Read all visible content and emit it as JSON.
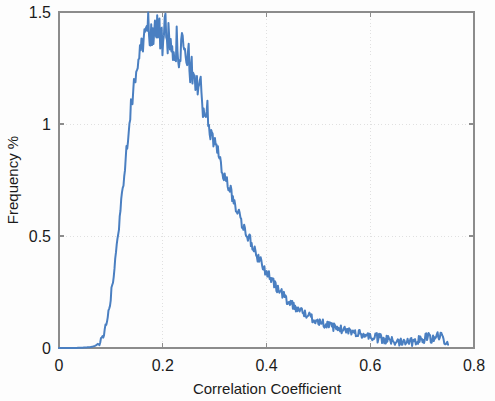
{
  "figure": {
    "background_color": "#fdfdfd",
    "axes_color": "#8c8c8c",
    "grid_color": "#d8d8d8",
    "text_color": "#1b1b1b"
  },
  "chart_data": {
    "type": "line",
    "title": "",
    "xlabel": "Correlation Coefficient",
    "ylabel": "Frequency %",
    "xlim": [
      0,
      0.8
    ],
    "ylim": [
      0,
      1.5
    ],
    "xticks": [
      0,
      0.2,
      0.4,
      0.6,
      0.8
    ],
    "xtick_labels": [
      "0",
      "0.2",
      "0.4",
      "0.6",
      "0.8"
    ],
    "yticks": [
      0,
      0.5,
      1,
      1.5
    ],
    "ytick_labels": [
      "0",
      "0.5",
      "1",
      "1.5"
    ],
    "grid": true,
    "legend": null,
    "legend_position": "none",
    "series": [
      {
        "name": "Correlation coefficient distribution",
        "color": "#4a7fc1",
        "line_width": 2.0,
        "x": [
          0.0,
          0.01,
          0.02,
          0.03,
          0.04,
          0.05,
          0.06,
          0.065,
          0.07,
          0.075,
          0.08,
          0.085,
          0.09,
          0.095,
          0.1,
          0.105,
          0.11,
          0.115,
          0.12,
          0.125,
          0.13,
          0.135,
          0.14,
          0.145,
          0.15,
          0.155,
          0.16,
          0.165,
          0.17,
          0.175,
          0.18,
          0.185,
          0.19,
          0.195,
          0.2,
          0.205,
          0.21,
          0.215,
          0.22,
          0.225,
          0.23,
          0.235,
          0.24,
          0.245,
          0.25,
          0.255,
          0.26,
          0.265,
          0.27,
          0.275,
          0.28,
          0.285,
          0.29,
          0.295,
          0.3,
          0.31,
          0.32,
          0.33,
          0.34,
          0.35,
          0.36,
          0.37,
          0.38,
          0.39,
          0.4,
          0.41,
          0.42,
          0.43,
          0.44,
          0.45,
          0.46,
          0.47,
          0.48,
          0.49,
          0.5,
          0.51,
          0.52,
          0.53,
          0.54,
          0.55,
          0.56,
          0.57,
          0.58,
          0.59,
          0.6,
          0.61,
          0.62,
          0.63,
          0.64,
          0.65,
          0.66,
          0.67,
          0.68,
          0.69,
          0.7,
          0.71,
          0.72,
          0.73,
          0.74,
          0.75
        ],
        "y": [
          0.0,
          0.0,
          0.0,
          0.0,
          0.001,
          0.002,
          0.004,
          0.006,
          0.01,
          0.018,
          0.03,
          0.055,
          0.095,
          0.15,
          0.23,
          0.32,
          0.42,
          0.53,
          0.65,
          0.77,
          0.89,
          1.0,
          1.1,
          1.18,
          1.25,
          1.31,
          1.35,
          1.39,
          1.43,
          1.4,
          1.42,
          1.45,
          1.4,
          1.42,
          1.38,
          1.4,
          1.37,
          1.4,
          1.37,
          1.35,
          1.34,
          1.33,
          1.31,
          1.29,
          1.27,
          1.25,
          1.22,
          1.19,
          1.16,
          1.12,
          1.08,
          1.04,
          1.0,
          0.96,
          0.92,
          0.84,
          0.76,
          0.7,
          0.64,
          0.58,
          0.52,
          0.47,
          0.42,
          0.38,
          0.34,
          0.3,
          0.27,
          0.24,
          0.215,
          0.195,
          0.175,
          0.16,
          0.145,
          0.13,
          0.12,
          0.11,
          0.1,
          0.092,
          0.086,
          0.08,
          0.075,
          0.07,
          0.064,
          0.058,
          0.052,
          0.046,
          0.04,
          0.036,
          0.032,
          0.03,
          0.032,
          0.036,
          0.03,
          0.04,
          0.034,
          0.05,
          0.038,
          0.06,
          0.042,
          0.03
        ]
      }
    ]
  }
}
